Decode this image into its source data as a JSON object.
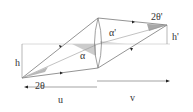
{
  "diagram": {
    "type": "lens-imaging-geometry",
    "labels": {
      "object_height": "h",
      "image_height": "h'",
      "object_cone_angle": "2θ",
      "image_cone_angle": "2θ'",
      "object_axis_angle": "α",
      "image_axis_angle": "α'",
      "object_distance": "u",
      "image_distance": "v"
    },
    "colors": {
      "line": "#555555",
      "axis": "#cccccc",
      "shade": "#b8b8b8",
      "text": "#333333"
    }
  }
}
